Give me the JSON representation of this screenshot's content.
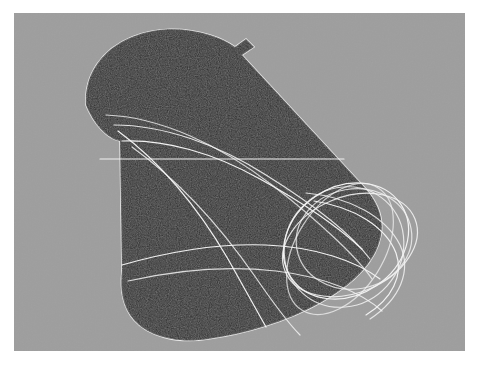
{
  "image": {
    "kind": "abstract-artwork",
    "title": "Dark organic wing form with white arc overlay",
    "width_px": 478,
    "height_px": 366
  },
  "canvas": {
    "background_color": "#9e9e9e",
    "page_color": "#ffffff",
    "left_px": 14,
    "top_px": 13,
    "width_px": 451,
    "height_px": 338
  },
  "shapes": {
    "main_form": {
      "name": "dark-wing-form",
      "fill_color": "#262626",
      "outline_color": "#e8e8e8",
      "texture": "grainy-speckled",
      "path": "M 72 92 C 70 60 92 32 128 22 C 160 14 195 18 224 30 L 348 174 C 362 190 368 206 366 222 C 362 250 340 272 308 290 C 272 310 228 322 192 326 C 160 330 132 322 118 306 C 106 292 104 274 106 256 L 104 120 C 92 118 80 110 72 92 Z"
    },
    "notch_top": {
      "name": "top-edge-notch",
      "path": "M 136 26 L 146 40 L 140 42 L 130 30 Z"
    },
    "notch_left": {
      "name": "left-edge-concavity",
      "description": "concave inward curve on the left silhouette near mid height"
    }
  },
  "overlay_curves": {
    "name": "white-arc-family",
    "stroke_color": "#f2f2f2",
    "stroke_width": 1.2,
    "count": 9,
    "description": "family of thin intersecting elliptical arcs converging into a vortex loop at the right tip",
    "horizontal_rule": {
      "name": "horizontal-guide-line",
      "y": 146,
      "x_start": 86,
      "x_end": 330
    }
  },
  "chart_data": {
    "type": "scatter",
    "title": "Dark organic wing form with white arc overlay",
    "xlabel": "",
    "ylabel": "",
    "grid": false,
    "legend": "none",
    "x": [],
    "y": []
  }
}
